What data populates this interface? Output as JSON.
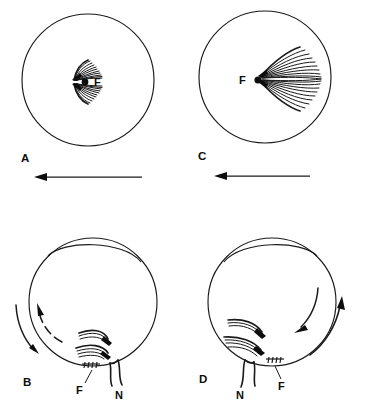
{
  "figure": {
    "background_color": "#ffffff",
    "ink_color": "#1a1a1a",
    "panels": [
      {
        "id": "A",
        "label": "A",
        "view": "fundus",
        "description": "Fundus view with a small fan of retinal nerve fibers converging at the fovea",
        "fovea_label": "F",
        "fovea_label_side": "right",
        "fan_size": "small",
        "fan_direction": "right",
        "fiber_count_upper": 11,
        "fiber_count_lower": 11,
        "arrow": {
          "label": "",
          "direction": "left",
          "style": "solid-straight"
        }
      },
      {
        "id": "C",
        "label": "C",
        "view": "fundus",
        "description": "Fundus view with a large expanded fan of retinal nerve fibers radiating from the fovea",
        "fovea_label": "F",
        "fovea_label_side": "left",
        "fan_size": "large",
        "fan_direction": "right",
        "fiber_count_upper": 10,
        "fiber_count_lower": 10,
        "arrow": {
          "label": "",
          "direction": "left",
          "style": "solid-straight"
        }
      },
      {
        "id": "B",
        "label": "B",
        "view": "globe-cross-section",
        "description": "Eye globe cross-section, nasal side left, showing fovea and optic nerve with rotation arrows",
        "fovea_label": "F",
        "nerve_label": "N",
        "fovea_label_position": "below-left",
        "nerve_label_position": "below-right",
        "arrows": [
          {
            "name": "outer-rotation-arrow",
            "style": "solid-curved",
            "direction": "clockwise-down"
          },
          {
            "name": "inner-rotation-arrow",
            "style": "dashed-curved",
            "direction": "counterclockwise-up"
          }
        ]
      },
      {
        "id": "D",
        "label": "D",
        "view": "globe-cross-section",
        "description": "Eye globe cross-section mirrored, showing fovea and optic nerve with rotation arrows",
        "fovea_label": "F",
        "nerve_label": "N",
        "fovea_label_position": "below-right",
        "nerve_label_position": "below-left",
        "arrows": [
          {
            "name": "outer-rotation-arrow",
            "style": "solid-curved",
            "direction": "counterclockwise-up"
          },
          {
            "name": "inner-rotation-arrow",
            "style": "solid-curved",
            "direction": "clockwise-down"
          }
        ]
      }
    ]
  }
}
